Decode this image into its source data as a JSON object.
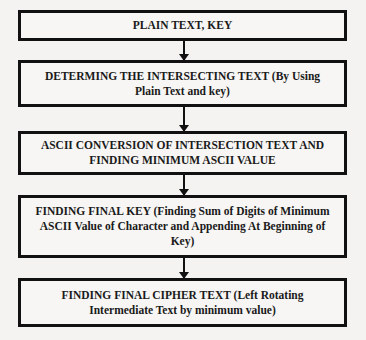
{
  "steps": [
    {
      "label": "PLAIN TEXT, KEY"
    },
    {
      "label": "DETERMING THE INTERSECTING TEXT (By Using Plain Text and key)"
    },
    {
      "label": "ASCII CONVERSION OF INTERSECTION TEXT AND FINDING MINIMUM ASCII VALUE"
    },
    {
      "label": "FINDING FINAL KEY (Finding Sum of Digits of Minimum ASCII Value of Character and Appending At Beginning of Key)"
    },
    {
      "label": "FINDING FINAL CIPHER TEXT (Left Rotating Intermediate Text by minimum value)"
    }
  ]
}
